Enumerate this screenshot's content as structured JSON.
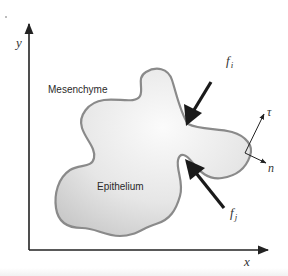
{
  "figure": {
    "axes": {
      "x_label": "x",
      "y_label": "y"
    },
    "regions": {
      "outer": "Mesenchyme",
      "inner": "Epithelium"
    },
    "forces": [
      {
        "symbol": "f",
        "subscript": "i"
      },
      {
        "symbol": "f",
        "subscript": "j"
      }
    ],
    "surface_vectors": {
      "tangent": "τ",
      "normal": "n"
    },
    "colors": {
      "axis": "#222222",
      "blob_fill_light": "#f7f7f7",
      "blob_fill_dark": "#cfcfcf",
      "blob_outline": "#8a8a8a",
      "arrow": "#1a1a1a"
    }
  }
}
